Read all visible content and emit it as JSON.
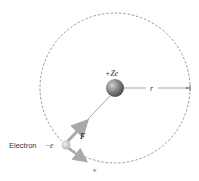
{
  "diagram": {
    "nucleus": {
      "label": "+Ze"
    },
    "radius": {
      "label": "r"
    },
    "electron": {
      "label": "Electron",
      "charge": "−e"
    },
    "force": {
      "label": "F"
    },
    "velocity": {
      "label": "v"
    },
    "colors": {
      "orbit": "#555555",
      "nucleus": "#7a7a7a",
      "arrow": "#a9a9a9",
      "electron": "#c8c8c8"
    }
  }
}
